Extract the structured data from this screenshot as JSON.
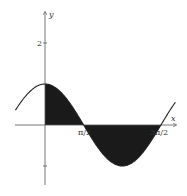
{
  "chart_data": {
    "type": "line",
    "title": "",
    "function": "y = cos(x)",
    "xlabel": "x",
    "ylabel": "y",
    "x_ticks": [
      {
        "value": 1.5708,
        "label": "π/2"
      },
      {
        "value": 4.7124,
        "label": "3π/2"
      }
    ],
    "y_ticks": [
      {
        "value": 2,
        "label": "2"
      },
      {
        "value": -1,
        "label": ""
      }
    ],
    "xlim": [
      -1.2,
      5.3
    ],
    "ylim": [
      -1.6,
      2.9
    ],
    "x": [
      -1.2,
      -0.8,
      -0.4,
      0,
      0.4,
      0.8,
      1.2,
      1.5708,
      2.0,
      2.4,
      2.8,
      3.1416,
      3.5,
      3.9,
      4.3,
      4.7124,
      5.1,
      5.3
    ],
    "values": [
      0.362,
      0.697,
      0.921,
      1,
      0.921,
      0.697,
      0.362,
      0,
      -0.416,
      -0.737,
      -0.942,
      -1,
      -0.936,
      -0.726,
      -0.401,
      0,
      0.378,
      0.554
    ],
    "shaded_regions": [
      {
        "from": 0,
        "to": 1.5708,
        "label": "area above x-axis"
      },
      {
        "from": 1.5708,
        "to": 4.7124,
        "label": "area below x-axis"
      }
    ],
    "grid": false,
    "legend": null
  },
  "labels": {
    "x_axis": "x",
    "y_axis": "y",
    "tick_y2": "2",
    "tick_pi_2": "π/2",
    "tick_3pi_2": "3π/2"
  }
}
